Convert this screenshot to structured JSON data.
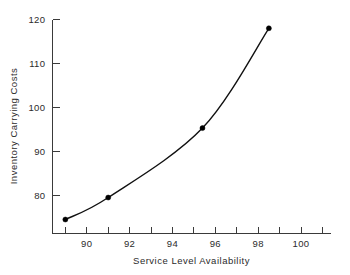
{
  "chart_data": {
    "type": "line",
    "title": "",
    "xlabel": "Service Level Availability",
    "ylabel": "Inventory Carrying Costs",
    "xlim": [
      88.4,
      101.4
    ],
    "ylim": [
      69.5,
      120
    ],
    "grid": false,
    "legend": "none",
    "x_tick_labels": [
      "90",
      "92",
      "94",
      "96",
      "98",
      "100"
    ],
    "x_tick_values": [
      90,
      92,
      94,
      96,
      98,
      100
    ],
    "x_minor_tick_values": [
      89,
      91,
      93,
      95,
      97,
      99,
      101
    ],
    "y_tick_labels": [
      "80",
      "90",
      "100",
      "110",
      "120"
    ],
    "y_tick_values": [
      80,
      90,
      100,
      110,
      120
    ],
    "series": [
      {
        "name": "Inventory Carrying Costs",
        "x": [
          89.0,
          91.0,
          95.4,
          98.5
        ],
        "values": [
          74.5,
          79.5,
          95.3,
          118.0
        ],
        "marker": "filled-circle",
        "color": "#000000"
      }
    ]
  },
  "axes": {
    "y_title": "Inventory Carrying Costs",
    "x_title": "Service Level Availability"
  }
}
